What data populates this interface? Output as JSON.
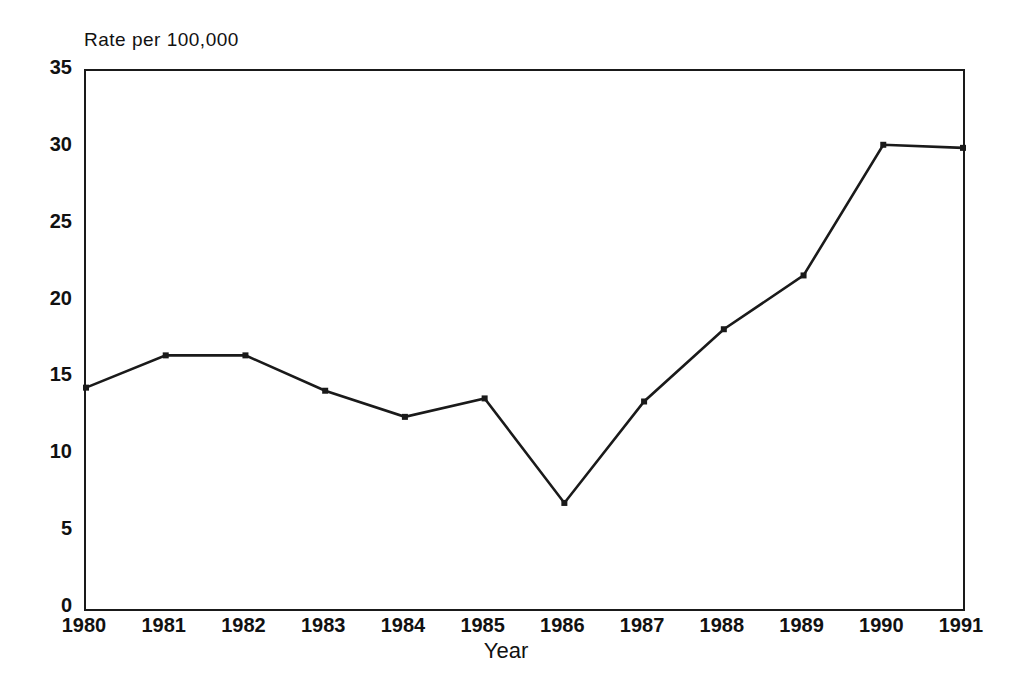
{
  "figure": {
    "y_axis_caption": "Rate per 100,000",
    "x_axis_caption": "Year",
    "line_color": "#1a1a1a",
    "axis_color": "#1a1a1a",
    "background_color": "#ffffff"
  },
  "chart_data": {
    "type": "line",
    "title": "",
    "subtitle": "",
    "xlabel": "Year",
    "ylabel": "Rate per 100,000",
    "xlim": [
      1980,
      1991
    ],
    "ylim": [
      0,
      35
    ],
    "grid": false,
    "legend": false,
    "legend_position": "none",
    "markers": "small filled square",
    "x": [
      1980,
      1981,
      1982,
      1983,
      1984,
      1985,
      1986,
      1987,
      1988,
      1989,
      1990,
      1991
    ],
    "xtick_labels": [
      "1980",
      "1981",
      "1982",
      "1983",
      "1984",
      "1985",
      "1986",
      "1987",
      "1988",
      "1989",
      "1990",
      "1991"
    ],
    "ytick_labels": [
      "0",
      "5",
      "10",
      "15",
      "20",
      "25",
      "30",
      "35"
    ],
    "yticks": [
      0,
      5,
      10,
      15,
      20,
      25,
      30,
      35
    ],
    "values": [
      14.4,
      16.5,
      16.5,
      14.2,
      12.5,
      13.7,
      6.9,
      13.5,
      18.2,
      21.7,
      30.2,
      30.0
    ],
    "series": [
      {
        "name": "Rate per 100,000",
        "values": [
          14.4,
          16.5,
          16.5,
          14.2,
          12.5,
          13.7,
          6.9,
          13.5,
          18.2,
          21.7,
          30.2,
          30.0
        ]
      }
    ],
    "annotations": []
  }
}
